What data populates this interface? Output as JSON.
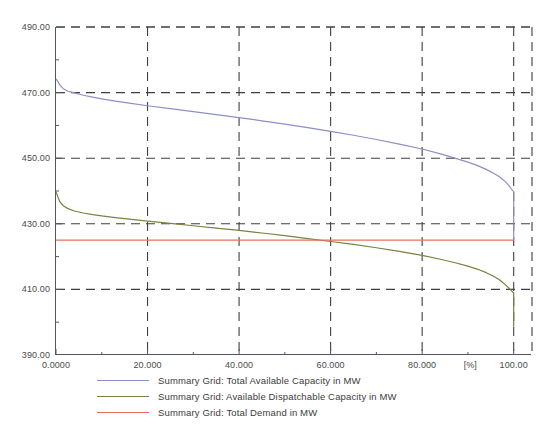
{
  "chart_data": {
    "type": "line",
    "title": "",
    "subtitle": "",
    "xlabel": "[%]",
    "ylabel": "",
    "xlim": [
      0,
      104
    ],
    "ylim": [
      390,
      490
    ],
    "grid": true,
    "grid_style": "dashed",
    "legend_position": "bottom",
    "x_unit": "[%]",
    "y_unit": "MW",
    "x_ticks": [
      0,
      20,
      40,
      60,
      80,
      100
    ],
    "x_tick_labels": [
      "0.0000",
      "20.000",
      "40.000",
      "60.000",
      "80.000",
      "100.00"
    ],
    "x_minor_ticks": [
      10,
      30,
      50,
      70,
      90
    ],
    "y_ticks": [
      390,
      410,
      430,
      450,
      470,
      490
    ],
    "y_tick_labels": [
      "390.00",
      "410.00",
      "430.00",
      "450.00",
      "470.00",
      "490.00"
    ],
    "y_minor_ticks": [
      400,
      420,
      440,
      460,
      480
    ],
    "series": [
      {
        "name": "Summary Grid: Total Available Capacity in MW",
        "color": "#8e8ec8",
        "x": [
          0.0,
          0.4,
          0.9,
          1.6,
          2.5,
          4.0,
          6.0,
          8.0,
          10.0,
          13.0,
          16.0,
          20.0,
          25.0,
          30.0,
          35.0,
          40.0,
          45.0,
          50.0,
          55.0,
          60.0,
          65.0,
          70.0,
          75.0,
          80.0,
          84.0,
          87.0,
          90.0,
          92.0,
          94.0,
          95.5,
          96.8,
          97.8,
          98.5,
          99.1,
          99.5,
          99.8,
          100.0,
          100.0
        ],
        "y": [
          474.2,
          473.4,
          472.2,
          471.2,
          470.5,
          469.9,
          469.2,
          468.6,
          468.1,
          467.4,
          466.8,
          466.0,
          465.1,
          464.2,
          463.3,
          462.4,
          461.4,
          460.4,
          459.3,
          458.2,
          457.0,
          455.7,
          454.3,
          452.8,
          451.3,
          450.1,
          448.8,
          447.8,
          446.6,
          445.5,
          444.4,
          443.3,
          442.4,
          441.4,
          440.6,
          440.1,
          439.8,
          425.0
        ]
      },
      {
        "name": "Summary Grid: Available Dispatchable Capacity in MW",
        "color": "#7c8040",
        "x": [
          0.0,
          0.4,
          0.9,
          1.6,
          2.5,
          4.0,
          6.0,
          8.0,
          10.0,
          13.0,
          16.0,
          20.0,
          25.0,
          30.0,
          35.0,
          40.0,
          45.0,
          50.0,
          55.0,
          60.0,
          65.0,
          70.0,
          75.0,
          80.0,
          84.0,
          87.0,
          90.0,
          92.0,
          94.0,
          95.5,
          96.8,
          97.8,
          98.5,
          99.1,
          99.5,
          99.8,
          100.0,
          100.0
        ],
        "y": [
          439.8,
          438.2,
          436.6,
          435.5,
          434.7,
          433.9,
          433.3,
          432.8,
          432.4,
          431.9,
          431.4,
          430.8,
          430.1,
          429.4,
          428.7,
          428.0,
          427.2,
          426.4,
          425.5,
          424.6,
          423.7,
          422.7,
          421.6,
          420.4,
          419.2,
          418.2,
          417.1,
          416.2,
          415.1,
          414.1,
          413.0,
          411.9,
          411.0,
          410.2,
          409.6,
          409.2,
          409.0,
          398.6
        ]
      },
      {
        "name": "Summary Grid: Total Demand in MW",
        "color": "#e8705a",
        "x": [
          0.0,
          100.0
        ],
        "y": [
          425.0,
          425.0
        ]
      }
    ]
  },
  "legend": {
    "items": [
      {
        "label": "Summary Grid: Total Available Capacity in MW",
        "color": "#8e8ec8"
      },
      {
        "label": "Summary Grid: Available Dispatchable Capacity in MW",
        "color": "#7c8040"
      },
      {
        "label": "Summary Grid: Total Demand in MW",
        "color": "#e8705a"
      }
    ]
  },
  "axes": {
    "x_unit_label": "[%]"
  }
}
